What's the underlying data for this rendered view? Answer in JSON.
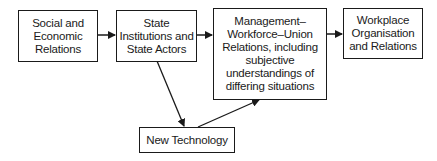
{
  "nodes": [
    {
      "id": "social",
      "label": "Social and\nEconomic\nRelations"
    },
    {
      "id": "state",
      "label": "State\nInstitutions and\nState Actors"
    },
    {
      "id": "mwu",
      "label": "Management–\nWorkforce–Union\nRelations, including\nsubjective\nunderstandings of\ndiffering situations"
    },
    {
      "id": "workplace",
      "label": "Workplace\nOrganisation\nand Relations"
    },
    {
      "id": "tech",
      "label": "New Technology"
    }
  ],
  "edges": [
    {
      "from": "social",
      "to": "state"
    },
    {
      "from": "state",
      "to": "mwu"
    },
    {
      "from": "mwu",
      "to": "workplace"
    },
    {
      "from": "state",
      "to": "tech"
    },
    {
      "from": "tech",
      "to": "mwu"
    }
  ]
}
